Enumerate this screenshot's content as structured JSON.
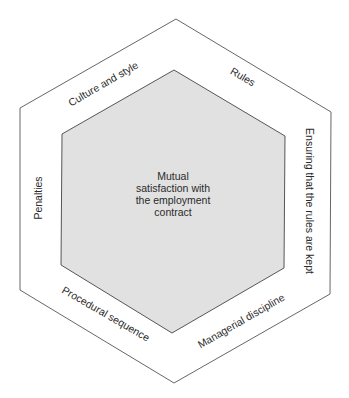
{
  "diagram": {
    "type": "hexagon-framework",
    "center": {
      "lines": [
        "Mutual",
        "satisfaction with",
        "the employment",
        "contract"
      ]
    },
    "sides": {
      "top_left": "Culture and style",
      "top_right": "Rules",
      "right": "Ensuring that the rules are kept",
      "bottom_right": "Managerial discipline",
      "bottom_left": "Procedural sequence",
      "left": "Penalties"
    },
    "colors": {
      "outer_stroke": "#555555",
      "inner_fill": "#e1e1e1",
      "inner_stroke": "#444444",
      "text": "#2a2a2a"
    }
  }
}
